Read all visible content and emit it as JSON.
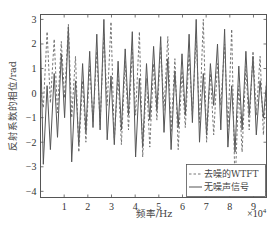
{
  "chart_data": {
    "type": "line",
    "title": "",
    "xlabel": "频率/Hz",
    "ylabel": "反射系数的相位/rad",
    "x_multiplier": "×10^4",
    "x_multiplier_base": "×10",
    "x_multiplier_exp": "4",
    "xlim": [
      0,
      9.55
    ],
    "ylim": [
      -4.25,
      3.2
    ],
    "xticks": [
      1,
      2,
      3,
      4,
      5,
      6,
      7,
      8,
      9
    ],
    "yticks": [
      3,
      2,
      1,
      0,
      -1,
      -2,
      -3,
      -4
    ],
    "grid": false,
    "legend_position": "lower right",
    "series": [
      {
        "name": "去噪的WTFT",
        "style": "dashed",
        "color": "#666666",
        "x": [
          0,
          0.12,
          0.28,
          0.42,
          0.58,
          0.72,
          0.88,
          1.02,
          1.18,
          1.32,
          1.48,
          1.62,
          1.78,
          1.92,
          2.08,
          2.22,
          2.38,
          2.52,
          2.68,
          2.82,
          2.98,
          3.12,
          3.28,
          3.42,
          3.58,
          3.72,
          3.88,
          4.02,
          4.18,
          4.32,
          4.48,
          4.62,
          4.78,
          4.92,
          5.08,
          5.22,
          5.38,
          5.52,
          5.68,
          5.82,
          5.98,
          6.12,
          6.28,
          6.42,
          6.58,
          6.72,
          6.88,
          7.02,
          7.18,
          7.32,
          7.48,
          7.62,
          7.78,
          7.92,
          8.08,
          8.22,
          8.38,
          8.52,
          8.68,
          8.82,
          8.98,
          9.12,
          9.28,
          9.42,
          9.55
        ],
        "y": [
          0.1,
          -0.6,
          2.5,
          -0.4,
          2.2,
          -0.8,
          2.1,
          -0.2,
          2.8,
          -1.0,
          1.5,
          -2.4,
          0.5,
          -2.0,
          1.1,
          -1.2,
          1.7,
          -1.3,
          2.4,
          -0.5,
          2.9,
          -1.9,
          0.7,
          -2.1,
          1.3,
          -1.5,
          1.8,
          -0.9,
          2.5,
          -2.6,
          0.6,
          -2.2,
          1.2,
          -1.1,
          1.9,
          -0.7,
          2.3,
          -1.6,
          1.4,
          -2.3,
          0.9,
          -1.4,
          1.6,
          -0.9,
          2.4,
          -1.2,
          3.0,
          -2.0,
          0.8,
          -1.7,
          1.2,
          -0.5,
          2.0,
          -1.5,
          2.6,
          -3.9,
          0.3,
          -2.4,
          1.1,
          -1.5,
          1.7,
          -0.9,
          1.5,
          -1.7,
          0.5
        ]
      },
      {
        "name": "无噪声信号",
        "style": "solid",
        "color": "#555555",
        "x": [
          0,
          0.12,
          0.28,
          0.42,
          0.58,
          0.72,
          0.88,
          1.02,
          1.18,
          1.32,
          1.48,
          1.62,
          1.78,
          1.92,
          2.08,
          2.22,
          2.38,
          2.52,
          2.68,
          2.82,
          2.98,
          3.12,
          3.28,
          3.42,
          3.58,
          3.72,
          3.88,
          4.02,
          4.18,
          4.32,
          4.48,
          4.62,
          4.78,
          4.92,
          5.08,
          5.22,
          5.38,
          5.52,
          5.68,
          5.82,
          5.98,
          6.12,
          6.28,
          6.42,
          6.58,
          6.72,
          6.88,
          7.02,
          7.18,
          7.32,
          7.48,
          7.62,
          7.78,
          7.92,
          8.08,
          8.22,
          8.38,
          8.52,
          8.68,
          8.82,
          8.98,
          9.12,
          9.28,
          9.42,
          9.55
        ],
        "y": [
          2.2,
          -2.9,
          0.3,
          -2.3,
          0.8,
          -1.8,
          1.6,
          -1.0,
          2.7,
          -2.8,
          0.5,
          -2.1,
          1.2,
          -1.6,
          1.7,
          -1.4,
          2.4,
          -1.5,
          3.0,
          -1.9,
          0.7,
          -2.1,
          1.3,
          -1.5,
          1.8,
          -0.9,
          2.5,
          -2.6,
          0.6,
          -2.2,
          1.2,
          -1.1,
          1.9,
          -0.7,
          2.3,
          -1.6,
          1.4,
          -2.3,
          0.9,
          -1.4,
          1.6,
          -0.9,
          2.4,
          -1.2,
          3.0,
          -2.0,
          0.8,
          -1.7,
          1.2,
          -0.5,
          2.0,
          -1.5,
          2.6,
          -2.2,
          0.3,
          -2.4,
          1.1,
          -1.5,
          1.7,
          -0.9,
          1.5,
          -1.7,
          0.5,
          -1.0,
          0.4
        ]
      }
    ]
  },
  "legend": {
    "items": [
      {
        "label": "去噪的WTFT",
        "style": "dashed"
      },
      {
        "label": "无噪声信号",
        "style": "solid"
      }
    ]
  }
}
